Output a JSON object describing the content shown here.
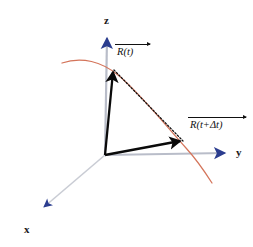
{
  "figure": {
    "background_color": "#ffffff",
    "width": 253,
    "height": 247
  },
  "colors": {
    "axis_line": "#b9bdc9",
    "axis_arrow": "#2b3d8f",
    "trajectory": "#d4745a",
    "vector": "#0a0a0a",
    "displacement_dashed": "#111111",
    "label_text": "#1a1a1a"
  },
  "axes": {
    "origin": {
      "x": 105,
      "y": 155
    },
    "items": [
      {
        "name": "z",
        "label": "z",
        "direction": "up",
        "line": {
          "x1": 105,
          "y1": 155,
          "x2": 107,
          "y2": 36
        },
        "arrow_tip": {
          "x": 107,
          "y": 31
        },
        "label_pos": {
          "x": 104,
          "y": 15
        }
      },
      {
        "name": "y",
        "label": "y",
        "direction": "right",
        "line": {
          "x1": 105,
          "y1": 155,
          "x2": 226,
          "y2": 153
        },
        "arrow_tip": {
          "x": 232,
          "y": 153
        },
        "label_pos": {
          "x": 236,
          "y": 147
        }
      },
      {
        "name": "x",
        "label": "x",
        "direction": "down-left",
        "line": {
          "x1": 105,
          "y1": 155,
          "x2": 42,
          "y2": 209
        },
        "arrow_tip": {
          "x": 36,
          "y": 214
        },
        "label_pos": {
          "x": 24,
          "y": 224
        }
      }
    ]
  },
  "trajectory": {
    "name": "particle-path",
    "stroke": "#d4745a",
    "stroke_width": 1.2,
    "path": "M 62,63 C 82,56 102,62 118,75 C 140,93 166,126 186,148 C 196,159 205,172 212,183"
  },
  "vectors": [
    {
      "name": "R-of-t",
      "label": "R(t)",
      "from": {
        "x": 105,
        "y": 155
      },
      "to": {
        "x": 113,
        "y": 70
      },
      "arrow_tip": {
        "x": 113,
        "y": 66
      },
      "color": "#0a0a0a",
      "label_pos": {
        "x": 117,
        "y": 47
      },
      "overline_width": 35
    },
    {
      "name": "R-of-t-plus-delta-t",
      "label": "R(t+Δt)",
      "from": {
        "x": 105,
        "y": 155
      },
      "to": {
        "x": 180,
        "y": 141
      },
      "arrow_tip": {
        "x": 186,
        "y": 143
      },
      "color": "#0a0a0a",
      "label_pos": {
        "x": 190,
        "y": 120
      },
      "overline_width": 58
    }
  ],
  "displacement": {
    "name": "delta-R-dashed-chord",
    "from": {
      "x": 113,
      "y": 70
    },
    "to": {
      "x": 184,
      "y": 142
    },
    "style": "dotted",
    "color": "#111111"
  }
}
